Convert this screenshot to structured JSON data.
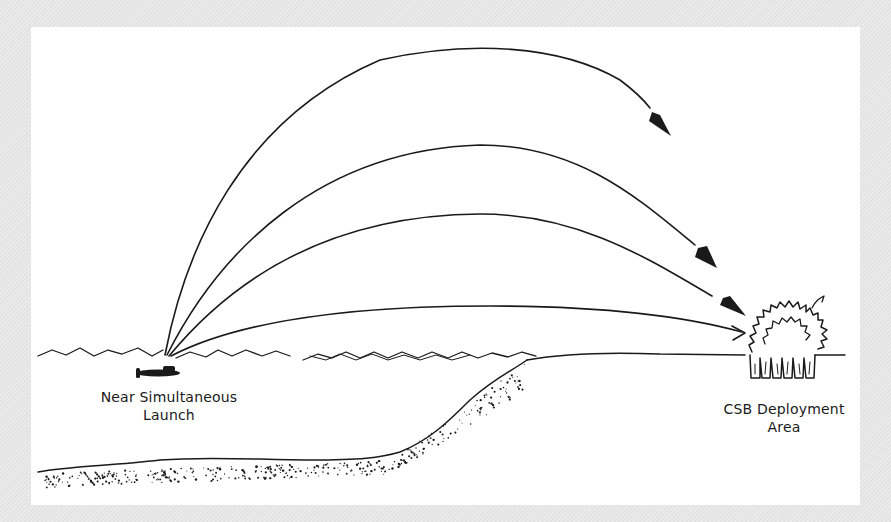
{
  "diagram": {
    "labels": {
      "launch_line1": "Near Simultaneous",
      "launch_line2": "Launch",
      "deploy_line1": "CSB Deployment",
      "deploy_line2": "Area"
    },
    "trajectories": [
      {
        "name": "trajectory-1",
        "apex_rank": 1,
        "reaches_target": false
      },
      {
        "name": "trajectory-2",
        "apex_rank": 2,
        "reaches_target": false
      },
      {
        "name": "trajectory-3",
        "apex_rank": 3,
        "reaches_target": false
      },
      {
        "name": "trajectory-4",
        "apex_rank": 4,
        "reaches_target": true
      }
    ],
    "icons": {
      "launcher": "submarine-icon",
      "target": "impact-burst-icon",
      "warheads": "arrowhead-icon"
    },
    "colors": {
      "ink": "#1a1a1a",
      "panel": "#ffffff",
      "frame": "#e6e6e6"
    }
  }
}
